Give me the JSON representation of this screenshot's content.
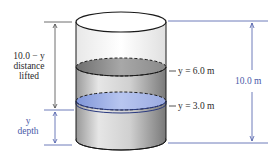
{
  "diagram": {
    "type": "cylindrical-tank-work-lifting",
    "colors": {
      "annotation_blue": "#4a5aa8",
      "text_dark": "#2a2a2a",
      "water_blue": "#8fa3e0",
      "gray_slice": "#8a8a8a",
      "tank_wall": "#d8d8d8"
    },
    "left_annotations": {
      "distance_label": {
        "line1": "10.0 − y",
        "line2": "distance",
        "line3": "lifted"
      },
      "depth_label": {
        "line1": "y",
        "line2": "depth"
      }
    },
    "level_labels": {
      "upper": "y = 6.0 m",
      "lower": "y = 3.0 m"
    },
    "right_annotation": {
      "height_label": "10.0 m"
    }
  }
}
